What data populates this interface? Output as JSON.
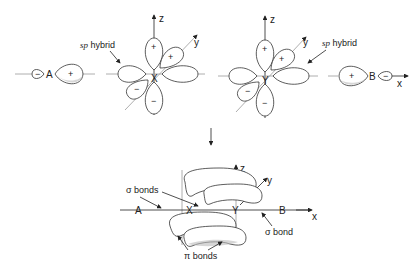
{
  "diagram": {
    "top_left": {
      "atom_A": "A",
      "atom_A_lobe_small_sign": "−",
      "atom_A_lobe_large_sign": "+",
      "center_atom": "X",
      "hybrid_label": "sp hybrid",
      "hybrid_label_prefix": "sp",
      "hybrid_label_suffix": " hybrid",
      "axis_z": "z",
      "axis_y": "y",
      "lobe_signs": [
        "+",
        "+",
        "−",
        "−"
      ]
    },
    "top_right": {
      "center_atom": "Y",
      "hybrid_label_prefix": "sp",
      "hybrid_label_suffix": " hybrid",
      "axis_z": "z",
      "axis_y": "y",
      "lobe_signs": [
        "+",
        "+",
        "−",
        "−"
      ],
      "atom_B": "B",
      "atom_B_lobe_large_sign": "+",
      "atom_B_lobe_small_sign": "−",
      "axis_x": "x"
    },
    "bottom": {
      "atoms": [
        "A",
        "X",
        "Y",
        "B"
      ],
      "axis_x": "x",
      "axis_y": "y",
      "axis_z": "z",
      "sigma_bonds_label": "σ bonds",
      "sigma_bond_label": "σ bond",
      "pi_bonds_label": "π bonds"
    }
  }
}
